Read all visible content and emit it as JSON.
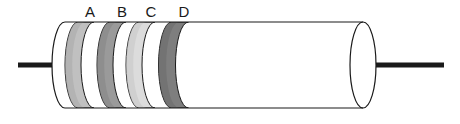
{
  "diagram": {
    "background_color": "#ffffff",
    "outline_color": "#1a1a1a",
    "body": {
      "fill": "#ffffff",
      "stroke": "#1a1a1a",
      "stroke_width": 1.2,
      "left_x": 65,
      "right_x": 363,
      "top_y": 22,
      "bottom_y": 108,
      "ellipse_rx": 13,
      "ellipse_ry": 43
    },
    "leads": [
      {
        "name": "left-lead",
        "color": "#1a1a1a",
        "x1": 18,
        "x2": 66,
        "y": 65,
        "thickness": 5
      },
      {
        "name": "right-lead",
        "color": "#1a1a1a",
        "x1": 356,
        "x2": 444,
        "y": 65,
        "thickness": 5
      }
    ],
    "bands": [
      {
        "label": "A",
        "color": "#c0c0c0",
        "shade_dark": "#a8a8a8",
        "shade_light": "#d2d2d2",
        "center_x": 86,
        "width": 16,
        "label_x": 90,
        "label_y": 17
      },
      {
        "label": "B",
        "color": "#9a9a9a",
        "shade_dark": "#858585",
        "shade_light": "#b0b0b0",
        "center_x": 118,
        "width": 16,
        "label_x": 122,
        "label_y": 17
      },
      {
        "label": "C",
        "color": "#dcdcdc",
        "shade_dark": "#c6c6c6",
        "shade_light": "#ececec",
        "center_x": 147,
        "width": 16,
        "label_x": 151,
        "label_y": 17
      },
      {
        "label": "D",
        "color": "#7e7e7e",
        "shade_dark": "#6a6a6a",
        "shade_light": "#949494",
        "center_x": 180,
        "width": 17,
        "label_x": 184,
        "label_y": 17
      }
    ]
  }
}
